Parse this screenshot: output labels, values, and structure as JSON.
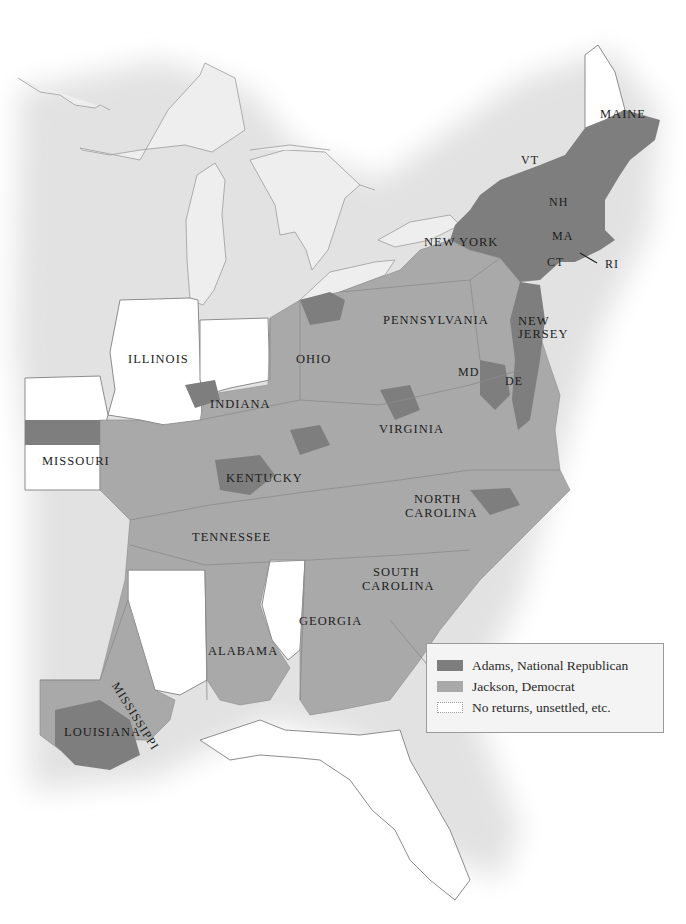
{
  "map": {
    "colors": {
      "adams": "#7e7e7e",
      "jackson": "#a9a9a9",
      "none": "#ffffff",
      "lakes": "#ececec",
      "border": "#8c8c8c",
      "shadow": "#e6e6e6"
    },
    "labels": {
      "maine": "MAINE",
      "vt": "VT",
      "nh": "NH",
      "ma": "MA",
      "ct": "CT",
      "ri": "RI",
      "new_york": "NEW YORK",
      "pennsylvania": "PENNSYLVANIA",
      "new_jersey_1": "NEW",
      "new_jersey_2": "JERSEY",
      "md": "MD",
      "de": "DE",
      "ohio": "OHIO",
      "illinois": "ILLINOIS",
      "indiana": "INDIANA",
      "missouri": "MISSOURI",
      "kentucky": "KENTUCKY",
      "virginia": "VIRGINIA",
      "north_carolina_1": "NORTH",
      "north_carolina_2": "CAROLINA",
      "tennessee": "TENNESSEE",
      "south_carolina_1": "SOUTH",
      "south_carolina_2": "CAROLINA",
      "georgia": "GEORGIA",
      "alabama": "ALABAMA",
      "mississippi": "MISSISSIPPI",
      "louisiana": "LOUISIANA"
    }
  },
  "legend": {
    "items": [
      {
        "label": "Adams, National Republican",
        "color": "#7e7e7e"
      },
      {
        "label": "Jackson, Democrat",
        "color": "#a9a9a9"
      },
      {
        "label": "No returns, unsettled, etc.",
        "color": "#ffffff"
      }
    ]
  }
}
